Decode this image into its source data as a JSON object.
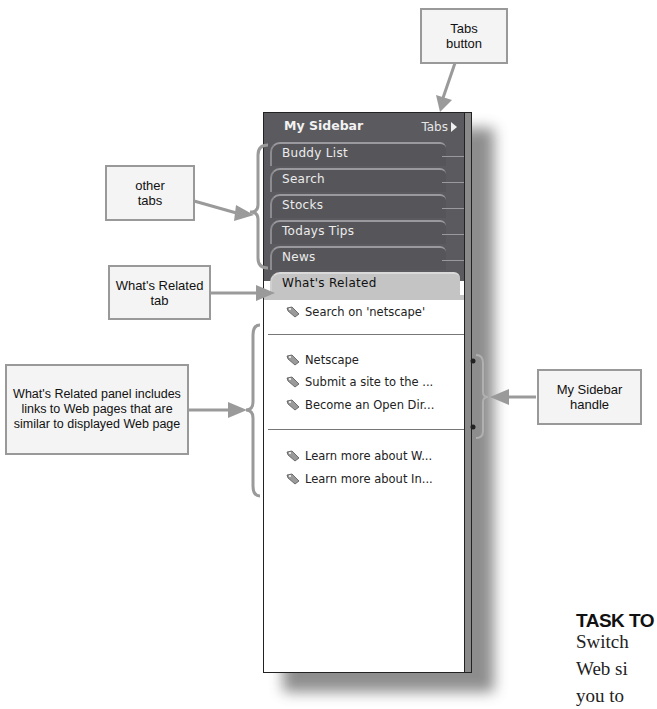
{
  "sidebar": {
    "title": "My Sidebar",
    "tabs_button": "Tabs",
    "tabs": [
      {
        "label": "Buddy List"
      },
      {
        "label": "Search"
      },
      {
        "label": "Stocks"
      },
      {
        "label": "Todays Tips"
      },
      {
        "label": "News"
      },
      {
        "label": "What's Related",
        "active": true
      }
    ],
    "panel": {
      "search_link": "Search on 'netscape'",
      "group1": [
        "Netscape",
        "Submit a site to the ...",
        "Become an Open Dir..."
      ],
      "group2": [
        "Learn more about W...",
        "Learn more about In..."
      ]
    },
    "colors": {
      "header_bg": "#5b5b5f",
      "active_tab_bg": "#c4c4c4",
      "panel_bg": "#ffffff"
    }
  },
  "callouts": {
    "tabs_button": "Tabs button",
    "other_tabs": "other tabs",
    "whats_related_tab": "What's Related tab",
    "whats_related_panel": "What's Related panel includes links to Web pages that are similar to displayed Web page",
    "sidebar_handle": "My Sidebar handle"
  },
  "task": {
    "heading": "TASK TO",
    "lines": [
      "Switch",
      "Web si",
      "you to"
    ]
  }
}
